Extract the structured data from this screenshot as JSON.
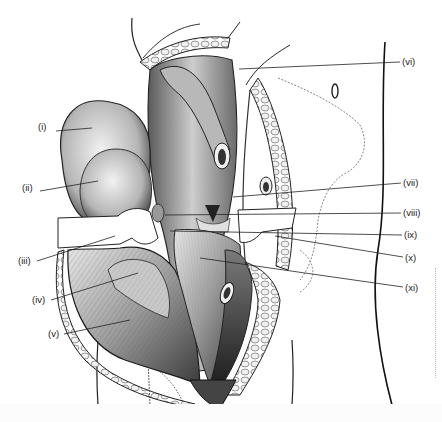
{
  "figure": {
    "type": "anatomical-illustration",
    "style": "grayscale pencil/ink medical drawing",
    "colors": {
      "background": "#ffffff",
      "ink": "#1a1a1a",
      "mid_tone": "#8a8a8a",
      "light_tone": "#d9d9d9",
      "retractor": "#ffffff"
    },
    "labels": [
      {
        "id": "i",
        "text": "(i)",
        "x": 38,
        "y": 126,
        "line": [
          56,
          131,
          92,
          128
        ]
      },
      {
        "id": "ii",
        "text": "(ii)",
        "x": 22,
        "y": 187,
        "line": [
          40,
          191,
          98,
          181
        ]
      },
      {
        "id": "iii",
        "text": "(iii)",
        "x": 18,
        "y": 257,
        "line": [
          37,
          261,
          115,
          236
        ]
      },
      {
        "id": "iv",
        "text": "(iv)",
        "x": 32,
        "y": 296,
        "line": [
          51,
          300,
          138,
          273
        ]
      },
      {
        "id": "v",
        "text": "(v)",
        "x": 48,
        "y": 330,
        "line": [
          64,
          334,
          130,
          320
        ]
      },
      {
        "id": "vi",
        "text": "(vi)",
        "x": 402,
        "y": 58,
        "line": [
          400,
          62,
          239,
          69
        ]
      },
      {
        "id": "vii",
        "text": "(vii)",
        "x": 403,
        "y": 178,
        "line": [
          401,
          183,
          233,
          197
        ]
      },
      {
        "id": "viii",
        "text": "(viii)",
        "x": 403,
        "y": 208,
        "line": [
          401,
          213,
          165,
          215
        ]
      },
      {
        "id": "ix",
        "text": "(ix)",
        "x": 404,
        "y": 231,
        "line": [
          402,
          235,
          170,
          231
        ]
      },
      {
        "id": "x",
        "text": "(x)",
        "x": 405,
        "y": 254,
        "line": [
          403,
          257,
          275,
          236
        ]
      },
      {
        "id": "xi",
        "text": "(xi)",
        "x": 405,
        "y": 284,
        "line": [
          403,
          287,
          200,
          258
        ]
      }
    ]
  }
}
